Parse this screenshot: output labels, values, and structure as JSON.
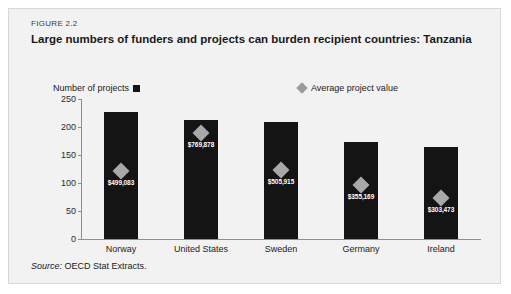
{
  "figure": {
    "number": "FIGURE 2.2",
    "title": "Large numbers of funders and projects can burden recipient countries: Tanzania",
    "source_label": "Source:",
    "source_text": " OECD Stat Extracts."
  },
  "legend": {
    "bars_label": "Number of projects",
    "bars_icon": "filled-square-icon",
    "markers_label": "Average project value",
    "markers_icon": "filled-diamond-icon"
  },
  "colors": {
    "bar": "#141414",
    "marker": "#a8a8a8",
    "card_background": "#f2f2f2",
    "axis": "#8e8e8e",
    "label_text": "#ffffff"
  },
  "chart_data": {
    "type": "bar",
    "title": "Large numbers of funders and projects can burden recipient countries: Tanzania",
    "xlabel": "",
    "ylabel": "Number of projects",
    "ylim": [
      0,
      250
    ],
    "yticks": [
      0,
      50,
      100,
      150,
      200,
      250
    ],
    "ytick_labels": [
      "0",
      "50",
      "100",
      "150",
      "200",
      "250"
    ],
    "grid": false,
    "legend_position": "above-plot",
    "categories": [
      "Norway",
      "United States",
      "Sweden",
      "Germany",
      "Ireland"
    ],
    "series": [
      {
        "name": "Number of projects",
        "type": "bar",
        "values": [
          227,
          212,
          209,
          174,
          164
        ]
      },
      {
        "name": "Average project value",
        "type": "marker",
        "values": [
          499083,
          769878,
          505915,
          355169,
          303473
        ],
        "value_labels": [
          "$499,083",
          "$769,878",
          "$505,915",
          "$355,169",
          "$303,473"
        ],
        "marker_plot_positions": [
          122,
          190,
          124,
          96,
          74
        ]
      }
    ]
  }
}
